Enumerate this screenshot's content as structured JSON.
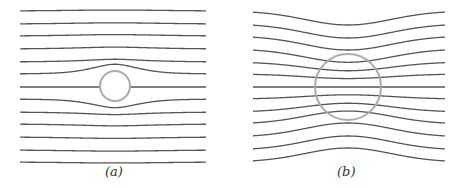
{
  "figure": {
    "panels": [
      {
        "id": "a",
        "caption": "(a)",
        "description": "Field lines bending around a small non-conducting sphere (lines diverge around it)",
        "x_range": [
          20,
          206
        ],
        "line_ys": [
          11,
          24,
          36,
          49,
          62,
          74,
          87,
          99,
          112,
          124,
          137,
          150,
          162
        ],
        "circle": {
          "cx": 115,
          "cy": 86,
          "r": 15
        },
        "lines_inside_circle": false
      },
      {
        "id": "b",
        "caption": "(b)",
        "description": "Field lines concentrated through a larger permeable sphere (lines converge and pass through it)",
        "x_range": [
          253,
          445
        ],
        "line_ys": [
          11,
          24,
          36,
          49,
          62,
          74,
          87,
          99,
          112,
          124,
          137,
          150,
          162
        ],
        "circle": {
          "cx": 348,
          "cy": 87,
          "r": 33
        },
        "lines_inside_circle": true
      }
    ],
    "colors": {
      "line": "#555555",
      "circle": "#aaaaaa",
      "background": "#ffffff"
    }
  }
}
